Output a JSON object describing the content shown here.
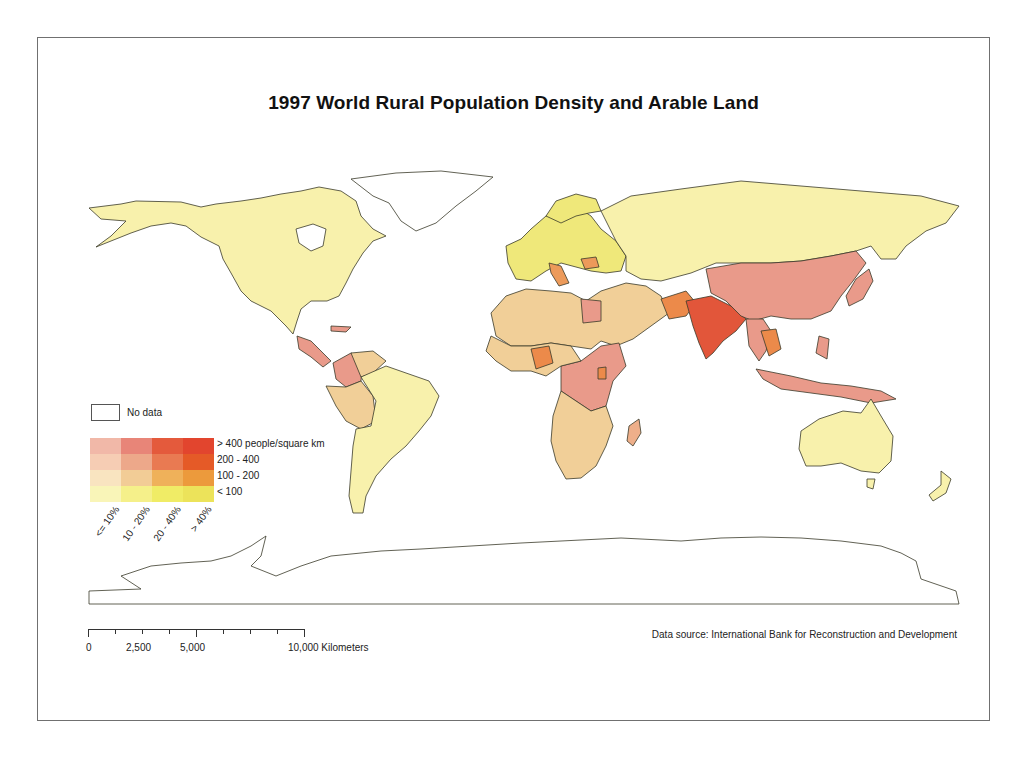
{
  "map": {
    "title": "1997 World Rural Population Density and Arable Land",
    "data_source": "Data source: International Bank for Reconstruction and Development",
    "colors": {
      "no_data": "#ffffff",
      "border": "#3a3a2a",
      "frame": "#707070"
    },
    "legend": {
      "no_data_label": "No data",
      "density_labels": [
        "> 400 people/square km",
        "200 - 400",
        "100 - 200",
        "< 100"
      ],
      "arable_labels": [
        "<= 10%",
        "10 - 20%",
        "20 - 40%",
        "> 40%"
      ],
      "matrix": [
        [
          "#f1b8a8",
          "#e88578",
          "#e45a3c",
          "#e2452e"
        ],
        [
          "#f6cdb4",
          "#eda88a",
          "#e97a52",
          "#e55a27"
        ],
        [
          "#f9e4c0",
          "#f2cc96",
          "#efb15a",
          "#ec9a3c"
        ],
        [
          "#f9f5b8",
          "#f5f08a",
          "#f0ec66",
          "#ece35a"
        ]
      ]
    },
    "scale_bar": {
      "labels": [
        "0",
        "2,500",
        "5,000",
        "10,000 Kilometers"
      ],
      "unit": "Kilometers"
    },
    "regions": [
      {
        "name": "Canada/USA/Alaska",
        "fill": "#f8f1ac"
      },
      {
        "name": "Greenland",
        "fill": "#ffffff"
      },
      {
        "name": "Central America",
        "fill": "#e99a8a"
      },
      {
        "name": "Colombia",
        "fill": "#e99a8a"
      },
      {
        "name": "South America (Brazil, Argentina, Chile)",
        "fill": "#f8f1ac"
      },
      {
        "name": "Peru/Bolivia/Paraguay/Venezuela",
        "fill": "#f1cf98"
      },
      {
        "name": "Russia/Kazakhstan/Mongolia",
        "fill": "#f8f1ac"
      },
      {
        "name": "Europe",
        "fill": "#efe87a"
      },
      {
        "name": "Italy/Romania",
        "fill": "#ec9a5a"
      },
      {
        "name": "North Africa/Middle East",
        "fill": "#f1cf98"
      },
      {
        "name": "Egypt/Ethiopia/Central Africa",
        "fill": "#e99a8a"
      },
      {
        "name": "Nigeria/Uganda",
        "fill": "#ec8a4a"
      },
      {
        "name": "Southern Africa",
        "fill": "#f1cf98"
      },
      {
        "name": "Madagascar",
        "fill": "#eeaf8a"
      },
      {
        "name": "India/Bangladesh",
        "fill": "#e2563a"
      },
      {
        "name": "Pakistan",
        "fill": "#ec8a4a"
      },
      {
        "name": "China",
        "fill": "#e99a8a"
      },
      {
        "name": "Southeast Asia/Indonesia/PNG",
        "fill": "#e99a8a"
      },
      {
        "name": "Thailand",
        "fill": "#ec8a4a"
      },
      {
        "name": "Japan/Korea",
        "fill": "#e99a8a"
      },
      {
        "name": "Australia/New Zealand",
        "fill": "#f8f1ac"
      },
      {
        "name": "Antarctica",
        "fill": "#ffffff"
      }
    ]
  }
}
